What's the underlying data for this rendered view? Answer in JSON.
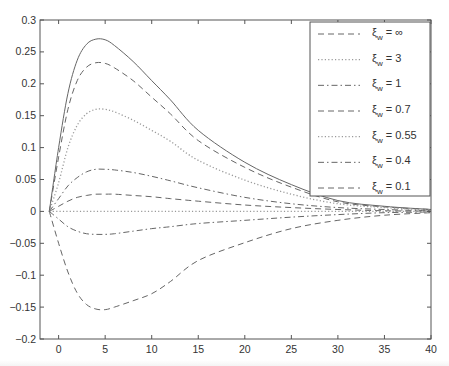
{
  "chart_data": {
    "type": "line",
    "title": "",
    "xlabel": "",
    "ylabel": "",
    "xlim": [
      -2,
      40
    ],
    "ylim": [
      -0.2,
      0.3
    ],
    "grid": false,
    "legend_position": "upper right",
    "x_ticks": [
      0,
      5,
      10,
      15,
      20,
      25,
      30,
      35,
      40
    ],
    "x_tick_labels": [
      "0",
      "5",
      "10",
      "15",
      "20",
      "25",
      "30",
      "35",
      "40"
    ],
    "y_ticks": [
      -0.2,
      -0.15,
      -0.1,
      -0.05,
      0,
      0.05,
      0.1,
      0.15,
      0.2,
      0.25,
      0.3
    ],
    "y_tick_labels": [
      "−0.2",
      "−0.15",
      "−0.1",
      "−0.05",
      "0",
      "0.05",
      "0.1",
      "0.15",
      "0.2",
      "0.25",
      "0.3"
    ],
    "x": [
      -1,
      0,
      1,
      2,
      3,
      4,
      5,
      6,
      8,
      10,
      12,
      15,
      20,
      25,
      30,
      35,
      40
    ],
    "series": [
      {
        "name": "unlabeled (solid)",
        "style": "solid",
        "in_legend": false,
        "values": [
          0,
          0.1,
          0.185,
          0.237,
          0.262,
          0.27,
          0.269,
          0.26,
          0.235,
          0.205,
          0.175,
          0.127,
          0.077,
          0.042,
          0.017,
          0.008,
          0.003
        ]
      },
      {
        "name": "ξ_w = ∞",
        "style": "dashed",
        "in_legend": true,
        "values": [
          0,
          0.085,
          0.16,
          0.205,
          0.226,
          0.233,
          0.232,
          0.225,
          0.205,
          0.179,
          0.153,
          0.111,
          0.069,
          0.038,
          0.015,
          0.007,
          0.003
        ]
      },
      {
        "name": "ξ_w = 3",
        "style": "dotted",
        "in_legend": true,
        "values": [
          0,
          0.045,
          0.1,
          0.135,
          0.153,
          0.16,
          0.16,
          0.156,
          0.143,
          0.127,
          0.11,
          0.08,
          0.049,
          0.027,
          0.012,
          0.006,
          0.002
        ]
      },
      {
        "name": "ξ_w = 1",
        "style": "dashdot",
        "in_legend": true,
        "values": [
          0,
          0.02,
          0.04,
          0.053,
          0.062,
          0.066,
          0.066,
          0.065,
          0.061,
          0.055,
          0.048,
          0.037,
          0.022,
          0.012,
          0.006,
          0.003,
          0.001
        ]
      },
      {
        "name": "ξ_w = 0.7",
        "style": "dashed",
        "in_legend": true,
        "values": [
          0,
          0.008,
          0.016,
          0.022,
          0.025,
          0.027,
          0.027,
          0.027,
          0.025,
          0.023,
          0.02,
          0.016,
          0.01,
          0.006,
          0.003,
          0.001,
          0.0005
        ]
      },
      {
        "name": "ξ_w = 0.55",
        "style": "dotted",
        "in_legend": true,
        "values": [
          0,
          0,
          0,
          0,
          0,
          0,
          0,
          0,
          0,
          0,
          0,
          0,
          0,
          0,
          0,
          0,
          0
        ]
      },
      {
        "name": "ξ_w = 0.4",
        "style": "dashdot",
        "in_legend": true,
        "values": [
          0,
          -0.012,
          -0.024,
          -0.031,
          -0.035,
          -0.036,
          -0.036,
          -0.035,
          -0.031,
          -0.027,
          -0.024,
          -0.019,
          -0.014,
          -0.009,
          -0.005,
          -0.002,
          -0.001
        ]
      },
      {
        "name": "ξ_w = 0.1",
        "style": "dashed",
        "in_legend": true,
        "values": [
          0,
          -0.05,
          -0.095,
          -0.128,
          -0.146,
          -0.153,
          -0.154,
          -0.15,
          -0.14,
          -0.129,
          -0.11,
          -0.077,
          -0.049,
          -0.027,
          -0.014,
          -0.006,
          -0.002
        ]
      }
    ],
    "legend_entries": [
      {
        "style": "dashed",
        "symbol": "ξ",
        "sub": "w",
        "rest": " = ∞"
      },
      {
        "style": "dotted",
        "symbol": "ξ",
        "sub": "w",
        "rest": " = 3"
      },
      {
        "style": "dashdot",
        "symbol": "ξ",
        "sub": "w",
        "rest": " = 1"
      },
      {
        "style": "dashed",
        "symbol": "ξ",
        "sub": "w",
        "rest": " = 0.7"
      },
      {
        "style": "dotted",
        "symbol": "ξ",
        "sub": "w",
        "rest": " = 0.55"
      },
      {
        "style": "dashdot",
        "symbol": "ξ",
        "sub": "w",
        "rest": " = 0.4"
      },
      {
        "style": "dashed",
        "symbol": "ξ",
        "sub": "w",
        "rest": " = 0.1"
      }
    ]
  },
  "colors": {
    "axis": "#555555",
    "line": "#666666",
    "dotted": "#9a9a9a",
    "background": "#ffffff"
  },
  "layout": {
    "plot_left": 40,
    "plot_right": 431,
    "plot_top": 20,
    "plot_bottom": 339,
    "legend_left": 310,
    "legend_top": 22,
    "legend_right": 430,
    "legend_bottom": 196
  }
}
